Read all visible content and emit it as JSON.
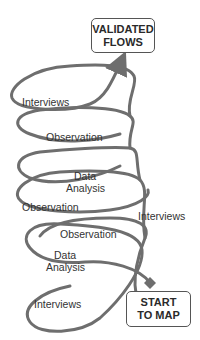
{
  "diagram": {
    "end_box": {
      "line1": "VALIDATED",
      "line2": "FLOWS"
    },
    "start_box": {
      "line1": "START",
      "line2": "TO MAP"
    },
    "loops": [
      {
        "label": "Interviews"
      },
      {
        "label": "Observation"
      },
      {
        "label_line1": "Data",
        "label_line2": "Analysis",
        "label_b": "Observation"
      },
      {
        "label": "Interviews"
      },
      {
        "label": "Observation"
      },
      {
        "label_line1": "Data",
        "label_line2": "Analysis"
      },
      {
        "label": "Interviews"
      }
    ],
    "colors": {
      "stroke": "#6e6e6e",
      "background": "#ffffff",
      "text": "#333333"
    }
  }
}
